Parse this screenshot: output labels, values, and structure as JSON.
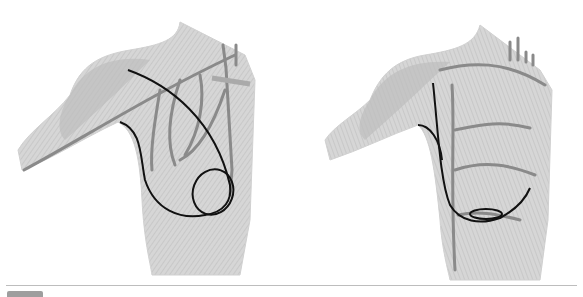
{
  "figure": {
    "panels": [
      {
        "id": "left",
        "description": "Anterior chest and shoulder anatomy with curved incision line and circular outline over lower chest"
      },
      {
        "id": "right",
        "description": "Anterior chest and shoulder anatomy with vertical-to-curved incision line ending in elliptical outline"
      }
    ],
    "colors": {
      "muscle": "#b8b8b8",
      "muscle_light": "#d6d6d6",
      "vessel": "#8a8a8a",
      "incision": "#111111",
      "outline": "#c8c8c8"
    },
    "footer": {
      "label": ""
    }
  }
}
